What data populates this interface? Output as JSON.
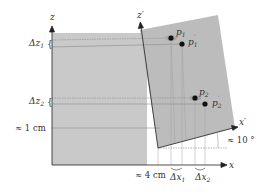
{
  "diagram": {
    "axes": {
      "z": "z",
      "x": "x",
      "z_prime": "z′",
      "x_prime": "x′"
    },
    "points": [
      {
        "id": "p1",
        "label": "p",
        "sub": "1",
        "prime": false
      },
      {
        "id": "p1_prime",
        "label": "p",
        "sub": "1",
        "prime": true
      },
      {
        "id": "p2",
        "label": "p",
        "sub": "2",
        "prime": false
      },
      {
        "id": "p2_prime",
        "label": "p",
        "sub": "2",
        "prime": true
      }
    ],
    "annotations": {
      "dz1": "Δz",
      "dz1_sub": "1",
      "dz2": "Δz",
      "dz2_sub": "2",
      "dx1": "Δx",
      "dx1_sub": "1",
      "dx2": "Δx",
      "dx2_sub": "2",
      "offset_z": "≈ 1 cm",
      "offset_x": "≈ 4 cm",
      "angle": "≈ 10 °"
    },
    "colors": {
      "region_fill": "#c8c8c8",
      "region_rotated_fill": "#bdbdbd",
      "axis": "#222222",
      "guide": "#9a9a9a",
      "point": "#111111"
    }
  }
}
